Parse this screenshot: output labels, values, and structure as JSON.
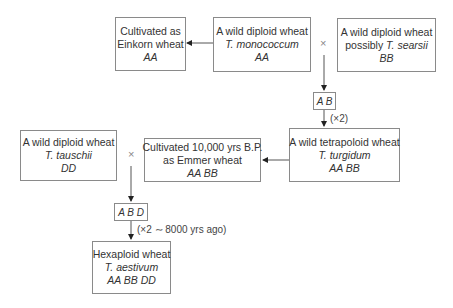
{
  "diagram": {
    "nodes": {
      "einkorn": {
        "line1": "Cultivated as",
        "line2": "Einkorn wheat",
        "genome": "AA"
      },
      "monococcum": {
        "line1": "A wild diploid wheat",
        "species": "T. monococcum",
        "genome": "AA"
      },
      "searsii": {
        "line1": "A wild diploid wheat",
        "line2_prefix": "possibly ",
        "species": "T. searsii",
        "genome": "BB"
      },
      "ab_hybrid": {
        "genome": "A B"
      },
      "turgidum": {
        "line1": "A wild tetrapoloid wheat",
        "species": "T. turgidum",
        "genome": "AA BB"
      },
      "emmer": {
        "line1": "Cultivated 10,000 yrs B.P.",
        "line2": "as Emmer wheat",
        "genome": "AA BB"
      },
      "tauschii": {
        "line1": "A wild diploid wheat",
        "species": "T. tauschii",
        "genome": "DD"
      },
      "abd_hybrid": {
        "genome": "A B D"
      },
      "aestivum": {
        "line1": "Hexaploid wheat",
        "species": "T. aestivum",
        "genome": "AA BB DD"
      }
    },
    "cross_symbol": "×",
    "annotations": {
      "doubling1": "(×2)",
      "doubling2": "(×2 ∼ 8000 yrs ago)"
    }
  }
}
